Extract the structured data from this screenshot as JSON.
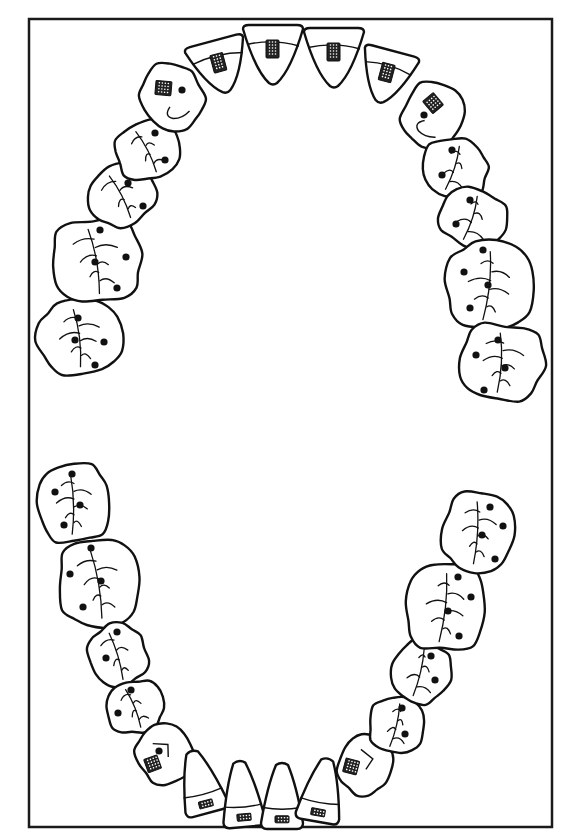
{
  "figure": {
    "colors": {
      "stroke": "#111111",
      "background": "#ffffff",
      "frame": "#1a1a1a"
    },
    "frame": {
      "x": 29,
      "y": 19,
      "width": 523,
      "height": 808
    }
  },
  "arches": {
    "upper": {
      "label": "Maxillary arch",
      "teeth": [
        {
          "id": "U-R8",
          "type": "molar",
          "cx": 80,
          "cy": 337,
          "rx": 42,
          "ry": 37,
          "rot": -5,
          "pits": [
            [
              78,
              318
            ],
            [
              104,
              342
            ],
            [
              95,
              365
            ],
            [
              75,
              340
            ]
          ],
          "marks": "none"
        },
        {
          "id": "U-R7",
          "type": "molar",
          "cx": 97,
          "cy": 260,
          "rx": 45,
          "ry": 42,
          "rot": -8,
          "pits": [
            [
              100,
              230
            ],
            [
              126,
              257
            ],
            [
              117,
              288
            ],
            [
              95,
              262
            ]
          ],
          "marks": "none"
        },
        {
          "id": "U-R6",
          "type": "premolar",
          "cx": 122,
          "cy": 195,
          "rx": 34,
          "ry": 30,
          "rot": -25,
          "pits": [
            [
              128,
              183
            ],
            [
              143,
              206
            ]
          ],
          "marks": "none"
        },
        {
          "id": "U-R5",
          "type": "premolar",
          "cx": 148,
          "cy": 150,
          "rx": 33,
          "ry": 29,
          "rot": -25,
          "pits": [
            [
              155,
              133
            ],
            [
              165,
              160
            ]
          ],
          "marks": "none"
        },
        {
          "id": "U-R4",
          "type": "canine",
          "cx": 172,
          "cy": 97,
          "rx": 30,
          "ry": 34,
          "rot": -25,
          "pits": [
            [
              182,
              90
            ]
          ],
          "marks": "stipple"
        },
        {
          "id": "U-R3",
          "type": "lateral",
          "cx": 220,
          "cy": 67,
          "rx": 30,
          "ry": 27,
          "rot": -15,
          "pits": [],
          "marks": "stipple"
        },
        {
          "id": "U-R1",
          "type": "central",
          "cx": 273,
          "cy": 55,
          "rx": 30,
          "ry": 30,
          "rot": 0,
          "pits": [],
          "marks": "stipple"
        },
        {
          "id": "U-L1",
          "type": "central",
          "cx": 334,
          "cy": 58,
          "rx": 30,
          "ry": 30,
          "rot": 0,
          "pits": [],
          "marks": "stipple"
        },
        {
          "id": "U-L3",
          "type": "lateral",
          "cx": 386,
          "cy": 77,
          "rx": 28,
          "ry": 27,
          "rot": 15,
          "pits": [],
          "marks": "stipple"
        },
        {
          "id": "U-L4",
          "type": "canine",
          "cx": 433,
          "cy": 115,
          "rx": 30,
          "ry": 33,
          "rot": 20,
          "pits": [
            [
              424,
              115
            ]
          ],
          "marks": "stipple"
        },
        {
          "id": "U-L5",
          "type": "premolar",
          "cx": 455,
          "cy": 168,
          "rx": 33,
          "ry": 29,
          "rot": 20,
          "pits": [
            [
              442,
              175
            ],
            [
              452,
              150
            ]
          ],
          "marks": "none"
        },
        {
          "id": "U-L6",
          "type": "premolar",
          "cx": 473,
          "cy": 218,
          "rx": 34,
          "ry": 29,
          "rot": 20,
          "pits": [
            [
              456,
              224
            ],
            [
              470,
              200
            ]
          ],
          "marks": "none"
        },
        {
          "id": "U-L7",
          "type": "molar",
          "cx": 490,
          "cy": 285,
          "rx": 44,
          "ry": 44,
          "rot": 8,
          "pits": [
            [
              464,
              272
            ],
            [
              488,
              285
            ],
            [
              470,
              308
            ],
            [
              483,
              250
            ]
          ],
          "marks": "none"
        },
        {
          "id": "U-L8",
          "type": "molar",
          "cx": 502,
          "cy": 362,
          "rx": 42,
          "ry": 38,
          "rot": 5,
          "pits": [
            [
              476,
              355
            ],
            [
              505,
              368
            ],
            [
              484,
              390
            ],
            [
              498,
              340
            ]
          ],
          "marks": "none"
        }
      ]
    },
    "lower": {
      "label": "Mandibular arch",
      "teeth": [
        {
          "id": "L-R8",
          "type": "molar",
          "cx": 74,
          "cy": 503,
          "rx": 36,
          "ry": 39,
          "rot": 0,
          "pits": [
            [
              72,
              474
            ],
            [
              55,
              492
            ],
            [
              80,
              505
            ],
            [
              64,
              525
            ]
          ],
          "marks": "none"
        },
        {
          "id": "L-R7",
          "type": "molar",
          "cx": 99,
          "cy": 583,
          "rx": 40,
          "ry": 44,
          "rot": -8,
          "pits": [
            [
              91,
              548
            ],
            [
              70,
              574
            ],
            [
              101,
              581
            ],
            [
              83,
              607
            ]
          ],
          "marks": "none"
        },
        {
          "id": "L-R6",
          "type": "premolar",
          "cx": 118,
          "cy": 655,
          "rx": 29,
          "ry": 31,
          "rot": -15,
          "pits": [
            [
              117,
              632
            ],
            [
              106,
              658
            ]
          ],
          "marks": "none"
        },
        {
          "id": "L-R5",
          "type": "premolar",
          "cx": 135,
          "cy": 707,
          "rx": 29,
          "ry": 26,
          "rot": -20,
          "pits": [
            [
              131,
              690
            ],
            [
              118,
              713
            ]
          ],
          "marks": "none"
        },
        {
          "id": "L-R4",
          "type": "canine",
          "cx": 165,
          "cy": 754,
          "rx": 28,
          "ry": 30,
          "rot": -20,
          "pits": [
            [
              159,
              751
            ]
          ],
          "marks": "stipple"
        },
        {
          "id": "L-R3",
          "type": "incisor",
          "cx": 200,
          "cy": 782,
          "rx": 22,
          "ry": 32,
          "rot": -15,
          "pits": [],
          "marks": "small-stipple"
        },
        {
          "id": "L-R1",
          "type": "incisor",
          "cx": 242,
          "cy": 794,
          "rx": 21,
          "ry": 33,
          "rot": -5,
          "pits": [],
          "marks": "small-stipple"
        },
        {
          "id": "L-L1",
          "type": "incisor",
          "cx": 282,
          "cy": 796,
          "rx": 21,
          "ry": 33,
          "rot": 0,
          "pits": [],
          "marks": "small-stipple"
        },
        {
          "id": "L-L3",
          "type": "incisor",
          "cx": 322,
          "cy": 790,
          "rx": 22,
          "ry": 32,
          "rot": 10,
          "pits": [],
          "marks": "small-stipple"
        },
        {
          "id": "L-L4",
          "type": "canine",
          "cx": 365,
          "cy": 765,
          "rx": 26,
          "ry": 30,
          "rot": 15,
          "pits": [],
          "marks": "stipple"
        },
        {
          "id": "L-L5",
          "type": "premolar",
          "cx": 397,
          "cy": 725,
          "rx": 28,
          "ry": 28,
          "rot": 15,
          "pits": [
            [
              402,
              708
            ],
            [
              405,
              734
            ]
          ],
          "marks": "none"
        },
        {
          "id": "L-L6",
          "type": "premolar",
          "cx": 421,
          "cy": 672,
          "rx": 29,
          "ry": 31,
          "rot": 15,
          "pits": [
            [
              431,
              656
            ],
            [
              435,
              680
            ]
          ],
          "marks": "none"
        },
        {
          "id": "L-L7",
          "type": "molar",
          "cx": 446,
          "cy": 607,
          "rx": 40,
          "ry": 44,
          "rot": 8,
          "pits": [
            [
              458,
              577
            ],
            [
              471,
              597
            ],
            [
              448,
              611
            ],
            [
              459,
              636
            ]
          ],
          "marks": "none"
        },
        {
          "id": "L-L8",
          "type": "molar",
          "cx": 478,
          "cy": 532,
          "rx": 35,
          "ry": 40,
          "rot": 5,
          "pits": [
            [
              490,
              507
            ],
            [
              503,
              526
            ],
            [
              482,
              535
            ],
            [
              495,
              559
            ]
          ],
          "marks": "none"
        }
      ]
    }
  }
}
